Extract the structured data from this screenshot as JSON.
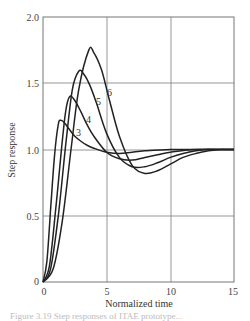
{
  "chart_data": {
    "type": "line",
    "title": "",
    "xlabel": "Normalized time",
    "ylabel": "Step response",
    "xlim": [
      0,
      15
    ],
    "ylim": [
      0,
      2.0
    ],
    "xticks": [
      0,
      5,
      10,
      15
    ],
    "xtick_labels": [
      "0",
      "5",
      "10",
      "15"
    ],
    "yticks": [
      0,
      0.5,
      1.0,
      1.5,
      2.0
    ],
    "ytick_labels": [
      "0",
      "0.5",
      "1.0",
      "1.5",
      "2.0"
    ],
    "grid": true,
    "legend": "none (inline curve labels)",
    "series": [
      {
        "name": "3",
        "label": "3",
        "x": [
          0,
          0.3,
          0.6,
          0.9,
          1.2,
          1.4,
          1.7,
          2.0,
          2.5,
          3.0,
          3.5,
          4.0,
          5.0,
          6.0,
          7.0,
          8.0,
          10.0,
          12.0,
          15.0
        ],
        "y": [
          0,
          0.15,
          0.55,
          0.95,
          1.19,
          1.22,
          1.2,
          1.16,
          1.1,
          1.06,
          1.03,
          1.01,
          0.98,
          0.97,
          0.98,
          0.99,
          1.0,
          1.0,
          1.0
        ]
      },
      {
        "name": "4",
        "label": "4",
        "x": [
          0,
          0.5,
          1.0,
          1.5,
          1.8,
          2.1,
          2.5,
          3.0,
          3.5,
          4.0,
          5.0,
          6.0,
          7.0,
          8.0,
          9.0,
          10.0,
          12.0,
          15.0
        ],
        "y": [
          0,
          0.12,
          0.55,
          1.05,
          1.3,
          1.4,
          1.37,
          1.28,
          1.18,
          1.1,
          0.98,
          0.93,
          0.92,
          0.94,
          0.96,
          0.98,
          1.0,
          1.0
        ]
      },
      {
        "name": "5",
        "label": "5",
        "x": [
          0,
          0.6,
          1.2,
          1.8,
          2.3,
          2.8,
          3.2,
          3.7,
          4.2,
          5.0,
          6.0,
          7.0,
          8.0,
          9.0,
          10.0,
          11.0,
          12.0,
          13.0,
          15.0
        ],
        "y": [
          0,
          0.1,
          0.5,
          1.05,
          1.45,
          1.59,
          1.57,
          1.48,
          1.35,
          1.12,
          0.94,
          0.87,
          0.87,
          0.9,
          0.94,
          0.97,
          0.99,
          1.0,
          1.0
        ]
      },
      {
        "name": "6",
        "label": "6",
        "x": [
          0,
          0.8,
          1.5,
          2.2,
          2.8,
          3.6,
          4.0,
          4.6,
          5.2,
          6.0,
          7.0,
          8.0,
          9.0,
          10.0,
          11.0,
          12.0,
          13.0,
          14.0,
          15.0
        ],
        "y": [
          0,
          0.1,
          0.45,
          1.0,
          1.45,
          1.75,
          1.73,
          1.6,
          1.38,
          1.1,
          0.88,
          0.82,
          0.84,
          0.89,
          0.94,
          0.97,
          0.99,
          1.0,
          1.0
        ]
      }
    ],
    "annotations": [
      "3",
      "4",
      "5",
      "6"
    ]
  },
  "caption": "Figure 3.19 Step responses of ITAE prototype..."
}
